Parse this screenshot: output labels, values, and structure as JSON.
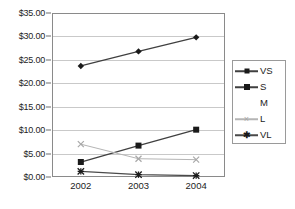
{
  "chart_data": {
    "type": "line",
    "title": "",
    "xlabel": "",
    "ylabel": "",
    "categories": [
      "2002",
      "2003",
      "2004"
    ],
    "ylim": [
      0,
      35
    ],
    "ytick_values": [
      0,
      5,
      10,
      15,
      20,
      25,
      30,
      35
    ],
    "ytick_labels": [
      "$0.00",
      "$5.00",
      "$10.00",
      "$15.00",
      "$20.00",
      "$25.00",
      "$30.00",
      "$35.00"
    ],
    "grid": true,
    "legend_position": "right",
    "series": [
      {
        "name": "VS",
        "values": [
          23.7,
          26.8,
          29.8
        ],
        "color": "#404040",
        "marker": "diamond",
        "marker_color": "#1a1a1a",
        "visible": true
      },
      {
        "name": "S",
        "values": [
          3.2,
          6.7,
          10.1
        ],
        "color": "#404040",
        "marker": "square",
        "marker_color": "#1a1a1a",
        "visible": true
      },
      {
        "name": "M",
        "values": [
          null,
          null,
          null
        ],
        "color": "#fdfdfd",
        "marker": "none",
        "marker_color": "#fdfdfd",
        "visible": false
      },
      {
        "name": "L",
        "values": [
          7.0,
          3.9,
          3.7
        ],
        "color": "#b5b5b5",
        "marker": "x",
        "marker_color": "#a8a8a8",
        "visible": true
      },
      {
        "name": "VL",
        "values": [
          1.2,
          0.5,
          0.3
        ],
        "color": "#4a4a4a",
        "marker": "asterisk",
        "marker_color": "#1a1a1a",
        "visible": true
      }
    ]
  },
  "axis": {
    "y_ticks": [
      {
        "label": "$35.00",
        "value": 35
      },
      {
        "label": "$30.00",
        "value": 30
      },
      {
        "label": "$25.00",
        "value": 25
      },
      {
        "label": "$20.00",
        "value": 20
      },
      {
        "label": "$15.00",
        "value": 15
      },
      {
        "label": "$10.00",
        "value": 10
      },
      {
        "label": "$5.00",
        "value": 5
      },
      {
        "label": "$0.00",
        "value": 0
      }
    ],
    "x_ticks": [
      {
        "label": "2002"
      },
      {
        "label": "2003"
      },
      {
        "label": "2004"
      }
    ]
  },
  "legend": {
    "items": [
      {
        "label": "VS"
      },
      {
        "label": "S"
      },
      {
        "label": "M"
      },
      {
        "label": "L"
      },
      {
        "label": "VL"
      }
    ]
  },
  "colors": {
    "grid": "#c9c9c9",
    "frame": "#8a8a8a",
    "text": "#1d1d1d",
    "background": "#ffffff"
  }
}
